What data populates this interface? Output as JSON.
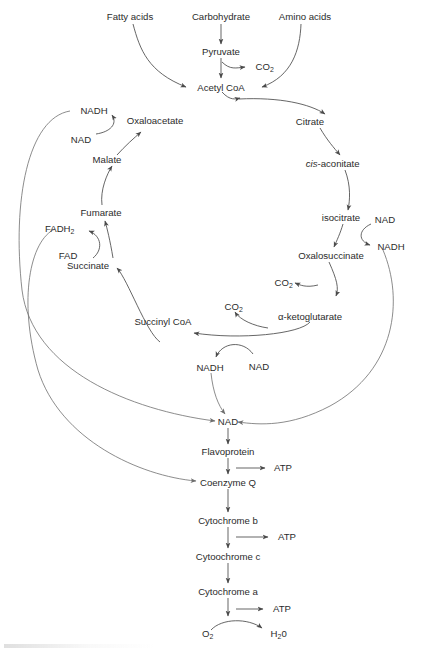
{
  "diagram": {
    "background_color": "#ffffff",
    "text_color": "#2b2b2b",
    "arrow_color": "#4a4a4a",
    "long_arrow_color": "#6e6e6e"
  },
  "inputs": {
    "fatty_acids": "Fatty acids",
    "carbohydrate": "Carbohydrate",
    "amino_acids": "Amino acids",
    "pyruvate": "Pyruvate",
    "acetyl_coa": "Acetyl CoA"
  },
  "cycle": {
    "citrate": "Citrate",
    "cis_aconitate_prefix": "cis",
    "cis_aconitate_rest": "-aconitate",
    "isocitrate": "isocitrate",
    "oxalosuccinate": "Oxalosuccinate",
    "alpha_ketoglutarate": "α-ketoglutarate",
    "succinyl_coa": "Succinyl CoA",
    "succinate": "Succinate",
    "fumarate": "Fumarate",
    "malate": "Malate",
    "oxaloacetate": "Oxaloacetate"
  },
  "cofactors": {
    "nadh_top_left": "NADH",
    "nad_top_left": "NAD",
    "fadh2_base": "FADH",
    "fadh2_sub": "2",
    "fad": "FAD",
    "nad_isocitrate": "NAD",
    "nadh_isocitrate": "NADH",
    "nadh_ketoglutarate": "NADH",
    "nad_ketoglutarate": "NAD",
    "nad_chain_entry": "NAD"
  },
  "byproducts": {
    "co2_pyruvate_base": "CO",
    "co2_pyruvate_sub": "2",
    "co2_oxalosuccinate_base": "CO",
    "co2_oxalosuccinate_sub": "2",
    "co2_ketoglutarate_base": "CO",
    "co2_ketoglutarate_sub": "2"
  },
  "electron_transport_chain": {
    "flavoprotein": "Flavoprotein",
    "coenzyme_q": "Coenzyme Q",
    "cytochrome_b": "Cytochrome b",
    "cytochrome_c": "Cytoochrome c",
    "cytochrome_a": "Cytochrome a",
    "atp_1": "ATP",
    "atp_2": "ATP",
    "atp_3": "ATP",
    "oxygen_base": "O",
    "oxygen_sub": "2",
    "water_base": "H",
    "water_sub": "2",
    "water_tail": "0"
  }
}
